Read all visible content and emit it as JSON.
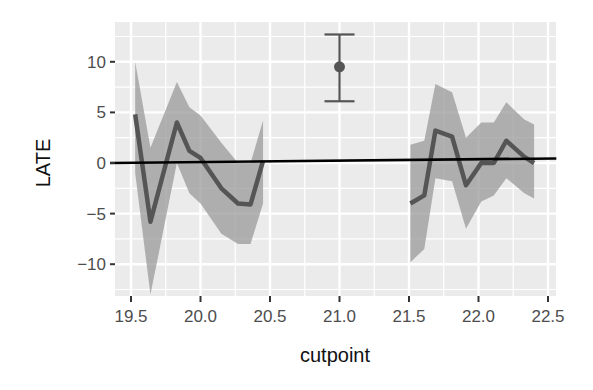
{
  "chart_data": {
    "type": "line",
    "title": "",
    "xlabel": "cutpoint",
    "ylabel": "LATE",
    "xlim": [
      19.38,
      22.56
    ],
    "ylim": [
      -13,
      14
    ],
    "x_ticks": [
      19.5,
      20.0,
      20.5,
      21.0,
      21.5,
      22.0,
      22.5
    ],
    "x_tick_labels": [
      "19.5",
      "20.0",
      "20.5",
      "21.0",
      "21.5",
      "22.0",
      "22.5"
    ],
    "y_ticks": [
      10,
      5,
      0,
      -5,
      -10
    ],
    "y_tick_labels": [
      "10",
      "5",
      "0",
      "−5",
      "−10"
    ],
    "grid": true,
    "legend": "none",
    "series": [
      {
        "name": "LATE (left segment)",
        "type": "line_with_ribbon",
        "x": [
          19.53,
          19.64,
          19.83,
          19.92,
          20.0,
          20.15,
          20.27,
          20.36,
          20.45
        ],
        "y": [
          4.8,
          -5.8,
          4.0,
          1.2,
          0.5,
          -2.5,
          -4.0,
          -4.1,
          0.2
        ],
        "upper": [
          10.0,
          1.5,
          8.0,
          5.5,
          4.7,
          2.0,
          0.0,
          0.0,
          4.2
        ],
        "lower": [
          -1.0,
          -13.0,
          0.0,
          -3.0,
          -4.0,
          -7.0,
          -8.0,
          -8.0,
          -4.0
        ]
      },
      {
        "name": "LATE (right segment)",
        "type": "line_with_ribbon",
        "x": [
          21.51,
          21.61,
          21.69,
          21.81,
          21.91,
          22.02,
          22.11,
          22.2,
          22.33,
          22.4
        ],
        "y": [
          -4.0,
          -3.2,
          3.2,
          2.6,
          -2.2,
          0.0,
          0.0,
          2.2,
          0.6,
          0.0
        ],
        "upper": [
          1.8,
          2.2,
          7.8,
          7.0,
          2.5,
          4.0,
          4.0,
          6.0,
          4.3,
          3.8
        ],
        "lower": [
          -9.8,
          -8.5,
          -1.5,
          -1.8,
          -6.5,
          -3.8,
          -3.2,
          -1.5,
          -3.0,
          -3.5
        ]
      },
      {
        "name": "point estimate",
        "type": "pointrange",
        "x": 21.0,
        "y": 9.5,
        "upper": 12.7,
        "lower": 6.1
      },
      {
        "name": "reference line",
        "type": "line",
        "x": [
          19.35,
          22.56
        ],
        "y": [
          0.0,
          0.45
        ]
      }
    ],
    "colors": {
      "panel_bg": "#ebebeb",
      "grid": "#ffffff",
      "ribbon": "#9a9a9a",
      "line": "#555555",
      "pointrange": "#555555",
      "reference_line": "#000000"
    }
  }
}
